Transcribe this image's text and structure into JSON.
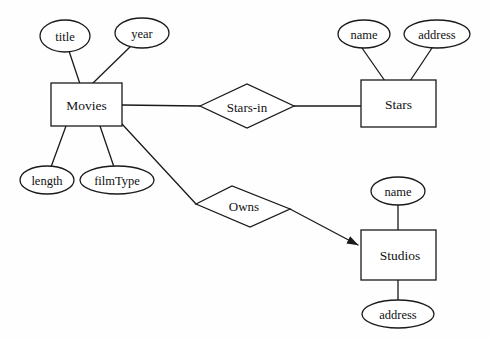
{
  "diagram": {
    "type": "entity-relationship-diagram",
    "colors": {
      "background": "#fefefe",
      "stroke": "#1a1a1a",
      "fill": "#ffffff",
      "text": "#111111"
    },
    "entities": [
      {
        "id": "movies",
        "label": "Movies",
        "x": 51,
        "y": 83,
        "w": 71,
        "h": 43
      },
      {
        "id": "stars",
        "label": "Stars",
        "x": 361,
        "y": 80,
        "w": 75,
        "h": 47
      },
      {
        "id": "studios",
        "label": "Studios",
        "x": 361,
        "y": 230,
        "w": 75,
        "h": 50
      }
    ],
    "relationships": [
      {
        "id": "stars-in",
        "label": "Stars-in",
        "cx": 247,
        "cy": 106
      },
      {
        "id": "owns",
        "label": "Owns",
        "cx": 243,
        "cy": 206
      }
    ],
    "attributes": [
      {
        "id": "title",
        "label": "title",
        "owner": "movies",
        "cx": 65,
        "cy": 36,
        "rx": 25,
        "ry": 16
      },
      {
        "id": "year",
        "label": "year",
        "owner": "movies",
        "cx": 142,
        "cy": 33,
        "rx": 27,
        "ry": 15
      },
      {
        "id": "length",
        "label": "length",
        "owner": "movies",
        "cx": 47,
        "cy": 180,
        "rx": 27,
        "ry": 14
      },
      {
        "id": "filmType",
        "label": "filmType",
        "owner": "movies",
        "cx": 117,
        "cy": 180,
        "rx": 37,
        "ry": 14
      },
      {
        "id": "name",
        "label": "name",
        "owner": "stars",
        "cx": 364,
        "cy": 34,
        "rx": 26,
        "ry": 14
      },
      {
        "id": "address",
        "label": "address",
        "owner": "stars",
        "cx": 437,
        "cy": 34,
        "rx": 33,
        "ry": 14
      },
      {
        "id": "s-name",
        "label": "name",
        "owner": "studios",
        "cx": 398,
        "cy": 191,
        "rx": 27,
        "ry": 14
      },
      {
        "id": "s-address",
        "label": "address",
        "owner": "studios",
        "cx": 398,
        "cy": 314,
        "rx": 36,
        "ry": 14
      }
    ],
    "edges": [
      {
        "id": "movies-title",
        "from": "title",
        "to": "movies",
        "arrow": false
      },
      {
        "id": "movies-year",
        "from": "year",
        "to": "movies",
        "arrow": false
      },
      {
        "id": "movies-length",
        "from": "length",
        "to": "movies",
        "arrow": false
      },
      {
        "id": "movies-filmtype",
        "from": "filmType",
        "to": "movies",
        "arrow": false
      },
      {
        "id": "movies-starsin",
        "from": "movies",
        "to": "stars-in",
        "arrow": false
      },
      {
        "id": "starsin-stars",
        "from": "stars-in",
        "to": "stars",
        "arrow": false
      },
      {
        "id": "stars-name",
        "from": "name",
        "to": "stars",
        "arrow": false
      },
      {
        "id": "stars-address",
        "from": "address",
        "to": "stars",
        "arrow": false
      },
      {
        "id": "movies-owns",
        "from": "movies",
        "to": "owns",
        "arrow": false
      },
      {
        "id": "owns-studios",
        "from": "owns",
        "to": "studios",
        "arrow": true
      },
      {
        "id": "studios-name",
        "from": "s-name",
        "to": "studios",
        "arrow": false
      },
      {
        "id": "studios-address",
        "from": "s-address",
        "to": "studios",
        "arrow": false
      }
    ]
  }
}
